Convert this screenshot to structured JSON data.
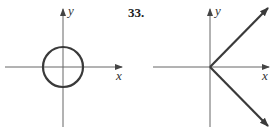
{
  "figures": [
    {
      "id": "left-graph",
      "shape": "circle",
      "x_label": "x",
      "y_label": "y"
    },
    {
      "id": "right-graph",
      "problem_number": "33.",
      "shape": "two rays from origin (V shape opening right)",
      "x_label": "x",
      "y_label": "y"
    }
  ],
  "colors": {
    "axis": "#555555",
    "curve": "#3a3a3a",
    "background": "#ffffff"
  }
}
